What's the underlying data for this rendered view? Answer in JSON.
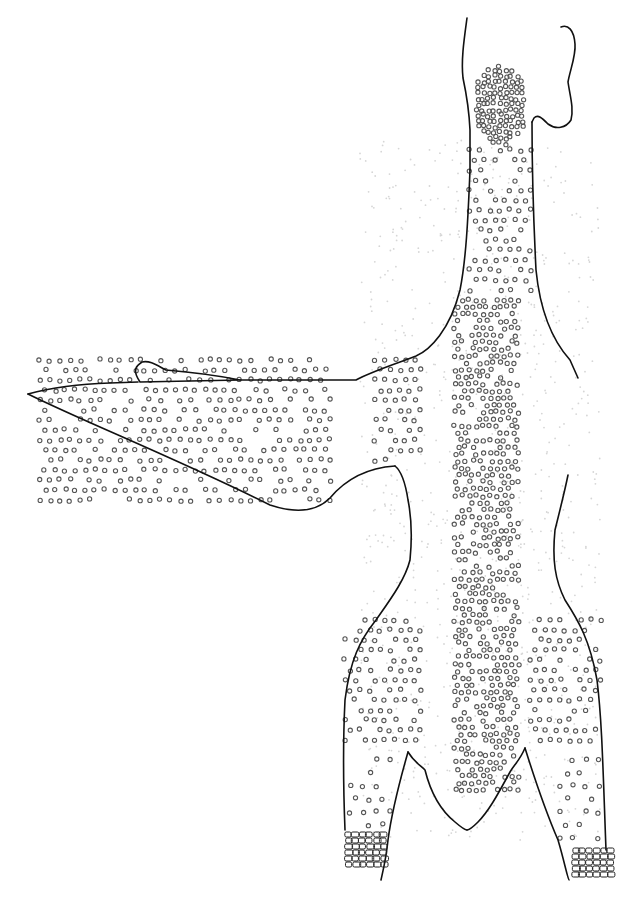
{
  "figure": {
    "width": 633,
    "height": 900,
    "background": "#ffffff",
    "line_color": "#111111",
    "dot_color": "#555555",
    "parts": [
      {
        "name": "head",
        "path": "M 467 18 C 464 40 461 60 463 78 C 466 92 469 108 470 130 L 470 170"
      },
      {
        "name": "head-right",
        "path": "M 561 27 C 568 24 574 30 575 44 C 576 56 570 70 568 82 C 570 96 574 108 571 120 C 566 128 556 130 548 124 C 542 118 538 114 534 118 L 532 122"
      },
      {
        "name": "neck-right",
        "path": "M 532 122 C 532 180 534 230 536 270 C 540 310 552 340 570 360 L 578 378"
      },
      {
        "name": "neck-left",
        "path": "M 470 170 C 468 220 466 260 460 290 C 450 330 430 350 416 356 C 395 364 370 372 356 380 L 240 380"
      },
      {
        "name": "wing-top",
        "path": "M 240 380 L 140 382 C 132 370 136 366 142 362 C 150 360 158 366 166 370 C 190 372 210 374 240 380"
      },
      {
        "name": "wing-leading-edge",
        "path": "M 138 382 L 110 383 C 80 384 50 388 28 394"
      },
      {
        "name": "wing-trailing-edge",
        "path": "M 28 394 C 80 420 180 460 270 505 C 300 515 318 510 330 498 C 345 480 365 468 395 466"
      },
      {
        "name": "body-left",
        "path": "M 395 466 C 400 470 405 480 408 500 C 412 520 412 540 410 560 C 405 580 390 600 376 620 C 360 640 350 660 345 700 C 343 740 343 780 345 830"
      },
      {
        "name": "body-right",
        "path": "M 568 475 C 565 490 560 510 555 530 C 552 560 555 580 565 600 C 578 620 590 640 597 680 C 602 720 603 770 606 850"
      },
      {
        "name": "left-leg-inner",
        "path": "M 408 752 C 400 780 392 810 388 840 C 386 860 382 875 381 880"
      },
      {
        "name": "right-leg-inner",
        "path": "M 525 748 C 535 780 545 810 558 840 C 564 860 568 880 569 880"
      },
      {
        "name": "tail-left",
        "path": "M 408 752 C 414 762 420 765 425 770 C 430 790 440 810 455 822 C 462 828 465 830 467 830"
      },
      {
        "name": "tail-right",
        "path": "M 525 748 C 520 760 514 765 510 772 C 500 790 490 810 478 822 C 472 828 468 830 467 830"
      }
    ],
    "feather_tracts": [
      {
        "name": "capital-tract",
        "cx": 500,
        "cy": 105,
        "rx": 28,
        "ry": 40,
        "density": "high"
      },
      {
        "name": "cervical-tract",
        "x1": 470,
        "y1": 150,
        "x2": 530,
        "y2": 290,
        "density": "medium"
      },
      {
        "name": "spinal-tract",
        "x1": 455,
        "y1": 300,
        "x2": 520,
        "y2": 790,
        "density": "high"
      },
      {
        "name": "humeral-tract",
        "x1": 375,
        "y1": 360,
        "x2": 420,
        "y2": 460,
        "density": "medium"
      },
      {
        "name": "alar-tract",
        "x1": 40,
        "y1": 360,
        "x2": 330,
        "y2": 500,
        "density": "medium"
      },
      {
        "name": "femoral-tract-left",
        "x1": 345,
        "y1": 620,
        "x2": 420,
        "y2": 740,
        "density": "medium"
      },
      {
        "name": "femoral-tract-right",
        "x1": 530,
        "y1": 620,
        "x2": 600,
        "y2": 740,
        "density": "medium"
      },
      {
        "name": "crural-tract-left",
        "x1": 350,
        "y1": 760,
        "x2": 395,
        "y2": 830,
        "density": "low"
      },
      {
        "name": "crural-tract-right",
        "x1": 560,
        "y1": 760,
        "x2": 600,
        "y2": 845,
        "density": "low"
      }
    ],
    "scutellae": [
      {
        "name": "left-tarsus-scales",
        "x": 345,
        "y": 832,
        "w": 42,
        "h": 34
      },
      {
        "name": "right-tarsus-scales",
        "x": 572,
        "y": 848,
        "w": 38,
        "h": 30
      }
    ]
  }
}
